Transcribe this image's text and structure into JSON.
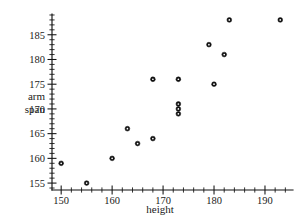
{
  "chart_data": {
    "type": "scatter",
    "title": "",
    "xlabel": "height",
    "ylabel_lines": [
      "arm",
      "span"
    ],
    "ylabel": "arm span",
    "xlim": [
      148.2,
      195.5
    ],
    "ylim": [
      153.6,
      189.2
    ],
    "xticks": [
      150,
      160,
      170,
      180,
      190
    ],
    "yticks": [
      155,
      160,
      165,
      170,
      175,
      180,
      185
    ],
    "xtick_labels": [
      "150",
      "160",
      "170",
      "180",
      "190"
    ],
    "ytick_labels": [
      "155",
      "160",
      "165",
      "170",
      "175",
      "180",
      "185"
    ],
    "x_minor_step": 2,
    "y_minor_step": 1,
    "grid": false,
    "legend": null,
    "marker": "open-circle",
    "marker_color": "#111111",
    "points": [
      {
        "x": 150,
        "y": 159
      },
      {
        "x": 155,
        "y": 155
      },
      {
        "x": 160,
        "y": 160
      },
      {
        "x": 163,
        "y": 166
      },
      {
        "x": 165,
        "y": 163
      },
      {
        "x": 168,
        "y": 164
      },
      {
        "x": 168,
        "y": 176
      },
      {
        "x": 173,
        "y": 176
      },
      {
        "x": 173,
        "y": 171
      },
      {
        "x": 173,
        "y": 170
      },
      {
        "x": 173,
        "y": 169
      },
      {
        "x": 179,
        "y": 183
      },
      {
        "x": 180,
        "y": 175
      },
      {
        "x": 182,
        "y": 181
      },
      {
        "x": 183,
        "y": 188
      },
      {
        "x": 193,
        "y": 188
      }
    ]
  }
}
